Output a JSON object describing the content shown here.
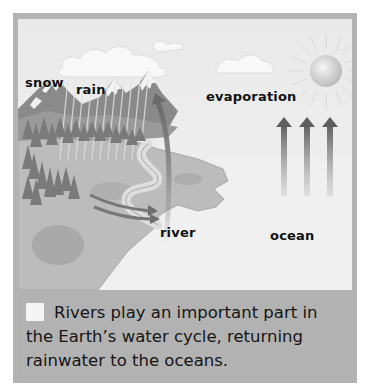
{
  "diagram": {
    "labels": {
      "snow": "snow",
      "rain": "rain",
      "evaporation": "evaporation",
      "river": "river",
      "ocean": "ocean"
    },
    "icons": [
      "sun-icon",
      "cloud-icon",
      "mountain-icon",
      "tree-icon",
      "evaporation-arrow-icon",
      "river-flow-arrow-icon"
    ]
  },
  "caption": {
    "text": "Rivers play an important part in the Earth’s water cycle, returning rainwater to the oceans."
  },
  "colors": {
    "frame": "#b4b4b4",
    "sky": "#eeeeee",
    "caption_bg": "#b2b2b2",
    "land": "#bdbdbd",
    "mountain": "#8a8a8a",
    "arrow": "#6e6e6e"
  }
}
